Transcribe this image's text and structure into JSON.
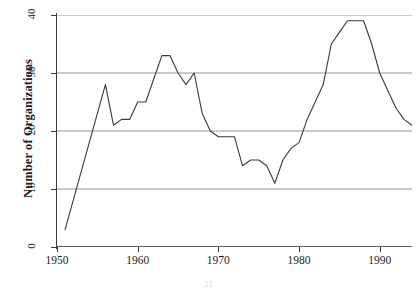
{
  "page_number": "21",
  "axes": {
    "ylabel": "Number of Organizations",
    "xlabel": "",
    "yticks": [
      "0",
      "10",
      "20",
      "30",
      "40"
    ],
    "xticks": [
      "1950",
      "1960",
      "1970",
      "1980",
      "1990"
    ]
  },
  "colors": {
    "line": "#3a3a3a",
    "grid": "#8a8a8a",
    "axis": "#3a3a3a",
    "background": "#ffffff"
  },
  "chart_data": {
    "type": "line",
    "title": "",
    "xlabel": "",
    "ylabel": "Number of Organizations",
    "xlim": [
      1950,
      1994
    ],
    "ylim": [
      0,
      40
    ],
    "grid": true,
    "gridlines_y": [
      0,
      10,
      20,
      30,
      40
    ],
    "legend": null,
    "x": [
      1951,
      1952,
      1953,
      1954,
      1955,
      1956,
      1957,
      1958,
      1959,
      1960,
      1961,
      1962,
      1963,
      1964,
      1965,
      1966,
      1967,
      1968,
      1969,
      1970,
      1971,
      1972,
      1973,
      1974,
      1975,
      1976,
      1977,
      1978,
      1979,
      1980,
      1981,
      1982,
      1983,
      1984,
      1985,
      1986,
      1987,
      1988,
      1989,
      1990,
      1991,
      1992,
      1993,
      1994
    ],
    "values": [
      3,
      8,
      13,
      18,
      23,
      28,
      21,
      22,
      22,
      25,
      25,
      29,
      33,
      33,
      30,
      28,
      30,
      23,
      20,
      19,
      19,
      19,
      14,
      15,
      15,
      14,
      11,
      15,
      17,
      18,
      22,
      25,
      28,
      35,
      37,
      39,
      39,
      39,
      35,
      30,
      27,
      24,
      22,
      21
    ],
    "series": [
      {
        "name": "Number of Organizations",
        "values": [
          3,
          8,
          13,
          18,
          23,
          28,
          21,
          22,
          22,
          25,
          25,
          29,
          33,
          33,
          30,
          28,
          30,
          23,
          20,
          19,
          19,
          19,
          14,
          15,
          15,
          14,
          11,
          15,
          17,
          18,
          22,
          25,
          28,
          35,
          37,
          39,
          39,
          39,
          35,
          30,
          27,
          24,
          22,
          21
        ]
      }
    ]
  }
}
